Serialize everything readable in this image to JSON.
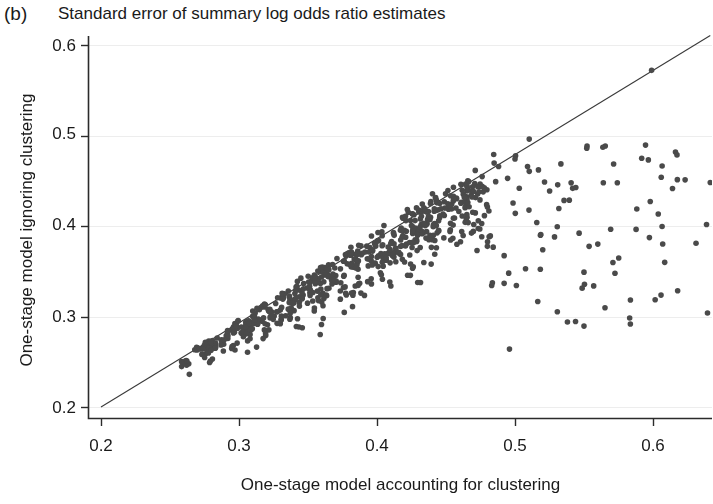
{
  "figure": {
    "panel_letter": "(b)",
    "title": "Standard error of summary log odds ratio estimates",
    "background_color": "#ffffff"
  },
  "chart_data": {
    "type": "scatter",
    "title": "Standard error of summary log odds ratio estimates",
    "panel": "(b)",
    "xlabel": "One-stage model accounting for clustering",
    "ylabel": "One-stage model ignoring clustering",
    "xlim": [
      0.2,
      0.642
    ],
    "ylim": [
      0.2,
      0.612
    ],
    "xticks": [
      0.2,
      0.3,
      0.4,
      0.5,
      0.6
    ],
    "xtick_labels": [
      "0.2",
      "0.3",
      "0.4",
      "0.5",
      "0.6"
    ],
    "yticks": [
      0.2,
      0.3,
      0.4,
      0.5,
      0.6
    ],
    "ytick_labels": [
      "0.2",
      "0.3",
      "0.4",
      "0.5",
      "0.6"
    ],
    "grid": "horizontal-faint",
    "legend": "none",
    "point_color": "#4a4a4a",
    "point_radius_px": 2.8,
    "n_points": 690,
    "reference_line": {
      "name": "identity-line",
      "type": "line",
      "label": "y = x",
      "x": [
        0.2,
        0.6415
      ],
      "y": [
        0.2,
        0.6105
      ],
      "color": "#3a3a3a",
      "width_px": 1.1
    },
    "distribution_note": "Points lie on or below the identity line; a dense elongated cluster runs from (0.26,0.245) to (0.47,0.44) hugging the diagonal, with a sparse scatter of outliers extending right to x=0.64 at y between 0.26 and 0.57",
    "cluster": {
      "x_range": [
        0.258,
        0.478
      ],
      "y_offset_below_diagonal": [
        0.0,
        0.075
      ],
      "n": 600
    },
    "outliers": {
      "x_range": [
        0.478,
        0.642
      ],
      "y_range": [
        0.26,
        0.575
      ],
      "n": 90
    },
    "notable_points": [
      [
        0.599,
        0.572
      ],
      [
        0.6415,
        0.448
      ],
      [
        0.552,
        0.486
      ],
      [
        0.5,
        0.474
      ],
      [
        0.517,
        0.462
      ],
      [
        0.598,
        0.427
      ],
      [
        0.56,
        0.38
      ],
      [
        0.55,
        0.349
      ],
      [
        0.538,
        0.294
      ],
      [
        0.486,
        0.449
      ],
      [
        0.48,
        0.421
      ],
      [
        0.47,
        0.438
      ],
      [
        0.496,
        0.264
      ]
    ]
  },
  "axes": {
    "x_axis_name": "One-stage model accounting for clustering",
    "y_axis_name": "One-stage model ignoring clustering",
    "spine_color": "#2b2b2b",
    "gridline_color": "#ededed"
  }
}
